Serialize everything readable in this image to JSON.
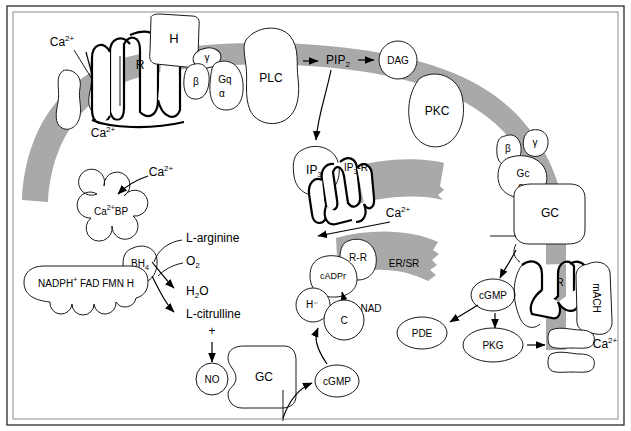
{
  "figure": {
    "domain_type": "diagram",
    "frame": {
      "border_color": "#3a3a3a",
      "inner_border_color": "#6e6e6e"
    },
    "palette": {
      "membrane_gray": "#a9a9a9",
      "ersr_gray": "#a9a9a9",
      "outline": "#1a1a1a",
      "background": "#ffffff"
    }
  },
  "labels": {
    "ca_extracellular": "Ca2+",
    "ca_intracellular": "Ca2+",
    "ca_from_ip3r": "Ca2+",
    "ca_to_bp": "Ca2+",
    "ca_right_channel": "Ca2+",
    "histamine": "H",
    "receptor_h": "R",
    "g_beta": "β",
    "g_gamma": "γ",
    "gq": "Gq",
    "g_alpha_q": "α",
    "plc": "PLC",
    "pip2": "PIP",
    "pip2_sub": "2",
    "dag": "DAG",
    "pkc": "PKC",
    "ip3": "IP",
    "ip3_sub": "3",
    "ip3r": "IP",
    "ip3r_sub": "3",
    "ip3r_tail": "-R",
    "ca_bp": "Ca2+BP",
    "bh4": "BH",
    "bh4_sub": "4",
    "nos_complex": "NADPH+ FAD  FMN  H",
    "l_arginine": "L-arginine",
    "o2": "O",
    "o2_sub": "2",
    "h2o": "H",
    "h2o_sub": "2",
    "h2o_tail": "O",
    "l_citrulline": "L-citrulline",
    "plus_sign": "+",
    "no": "NO",
    "gc_soluble": "GC",
    "cgmp_bottom": "cGMP",
    "er_sr": "ER/SR",
    "rr": "R-R",
    "cadpr": "cADPr",
    "nad": "NAD",
    "h_minus": "H⁻",
    "c_subunit": "C",
    "gc_membrane": "GC",
    "g_beta_right": "β",
    "g_gamma_right": "γ",
    "gc_alpha_name": "Gc",
    "g_alpha_right": "α",
    "cgmp_right": "cGMP",
    "pde": "PDE",
    "pkg": "PKG",
    "receptor_mach_r": "R",
    "mach": "mACH"
  },
  "nodes": [
    {
      "id": "ca-channel-left",
      "label": "",
      "kind": "ion-channel",
      "compartment": "plasma-membrane"
    },
    {
      "id": "h-ligand",
      "label": "H",
      "kind": "ligand",
      "compartment": "extracellular"
    },
    {
      "id": "h-receptor",
      "label": "R",
      "kind": "gpcr",
      "compartment": "plasma-membrane"
    },
    {
      "id": "g-protein-q",
      "label": "Gq",
      "kind": "g-protein",
      "subunits": [
        "α",
        "β",
        "γ"
      ]
    },
    {
      "id": "plc",
      "label": "PLC",
      "kind": "enzyme",
      "compartment": "plasma-membrane"
    },
    {
      "id": "pip2",
      "label": "PIP2",
      "kind": "lipid",
      "compartment": "plasma-membrane"
    },
    {
      "id": "dag",
      "label": "DAG",
      "kind": "second-messenger",
      "compartment": "plasma-membrane"
    },
    {
      "id": "pkc",
      "label": "PKC",
      "kind": "kinase",
      "compartment": "cytosol"
    },
    {
      "id": "ip3",
      "label": "IP3",
      "kind": "second-messenger",
      "compartment": "cytosol"
    },
    {
      "id": "ip3r",
      "label": "IP3-R",
      "kind": "receptor-channel",
      "compartment": "er-membrane"
    },
    {
      "id": "ca-bp",
      "label": "Ca2+BP",
      "kind": "binding-protein",
      "compartment": "cytosol"
    },
    {
      "id": "nos",
      "label": "NADPH+ FAD FMN H / BH4",
      "kind": "enzyme-complex",
      "compartment": "cytosol"
    },
    {
      "id": "no",
      "label": "NO",
      "kind": "gas-messenger",
      "compartment": "cytosol"
    },
    {
      "id": "gc-soluble",
      "label": "GC",
      "kind": "enzyme",
      "compartment": "cytosol"
    },
    {
      "id": "cgmp-bottom",
      "label": "cGMP",
      "kind": "second-messenger",
      "compartment": "cytosol"
    },
    {
      "id": "rr",
      "label": "R-R",
      "kind": "ryanodine-receptor",
      "compartment": "er-membrane"
    },
    {
      "id": "cadpr",
      "label": "cADPr",
      "kind": "second-messenger",
      "compartment": "cytosol"
    },
    {
      "id": "nad",
      "label": "NAD",
      "kind": "substrate",
      "compartment": "cytosol"
    },
    {
      "id": "h-minus",
      "label": "H⁻",
      "kind": "subunit",
      "compartment": "cytosol"
    },
    {
      "id": "c-subunit",
      "label": "C",
      "kind": "subunit",
      "compartment": "cytosol"
    },
    {
      "id": "er-sr",
      "label": "ER/SR",
      "kind": "organelle",
      "compartment": "cytosol"
    },
    {
      "id": "gc-membrane",
      "label": "GC",
      "kind": "enzyme",
      "compartment": "plasma-membrane"
    },
    {
      "id": "g-protein-c",
      "label": "Gc",
      "kind": "g-protein",
      "subunits": [
        "α",
        "β",
        "γ"
      ]
    },
    {
      "id": "cgmp-right",
      "label": "cGMP",
      "kind": "second-messenger",
      "compartment": "cytosol"
    },
    {
      "id": "pde",
      "label": "PDE",
      "kind": "enzyme",
      "compartment": "cytosol"
    },
    {
      "id": "pkg",
      "label": "PKG",
      "kind": "kinase",
      "compartment": "cytosol"
    },
    {
      "id": "mach-receptor",
      "label": "R",
      "kind": "gpcr",
      "compartment": "plasma-membrane"
    },
    {
      "id": "mach",
      "label": "mACH",
      "kind": "ligand-receptor",
      "compartment": "plasma-membrane"
    },
    {
      "id": "ca-channel-right",
      "label": "Ca2+",
      "kind": "ion-channel",
      "compartment": "plasma-membrane"
    }
  ],
  "edges": [
    {
      "from": "ca-channel-left",
      "to": "ca-intracellular",
      "type": "arrow"
    },
    {
      "from": "plc",
      "to": "pip2",
      "type": "arrow"
    },
    {
      "from": "pip2",
      "to": "dag",
      "type": "arrow"
    },
    {
      "from": "pip2",
      "to": "ip3",
      "type": "curved-arrow"
    },
    {
      "from": "dag",
      "to": "pkc",
      "type": "association"
    },
    {
      "from": "ip3",
      "to": "ip3r",
      "type": "binding"
    },
    {
      "from": "ip3r",
      "to": "ca-cytosol",
      "type": "arrow"
    },
    {
      "from": "ca-bp-source",
      "to": "ca-bp",
      "type": "curved-arrow"
    },
    {
      "from": "l-arginine",
      "to": "nos",
      "type": "curved-arrow"
    },
    {
      "from": "o2",
      "to": "nos",
      "type": "curved-arrow"
    },
    {
      "from": "nos",
      "to": "h2o",
      "type": "arrow"
    },
    {
      "from": "nos",
      "to": "l-citrulline",
      "type": "arrow"
    },
    {
      "from": "l-citrulline",
      "to": "no",
      "type": "arrow"
    },
    {
      "from": "gc-soluble",
      "to": "cgmp-bottom",
      "type": "arrow"
    },
    {
      "from": "cgmp-bottom",
      "to": "h-minus",
      "type": "curved-arrow"
    },
    {
      "from": "nad",
      "to": "cadpr",
      "type": "arrow"
    },
    {
      "from": "rr",
      "to": "ca-release",
      "type": "arrow"
    },
    {
      "from": "gc-membrane",
      "to": "cgmp-right",
      "type": "curved-arrow"
    },
    {
      "from": "cgmp-right",
      "to": "pde",
      "type": "arrow"
    },
    {
      "from": "cgmp-right",
      "to": "pkg",
      "type": "arrow"
    },
    {
      "from": "pkg",
      "to": "ca-channel-right",
      "type": "arrow"
    }
  ]
}
